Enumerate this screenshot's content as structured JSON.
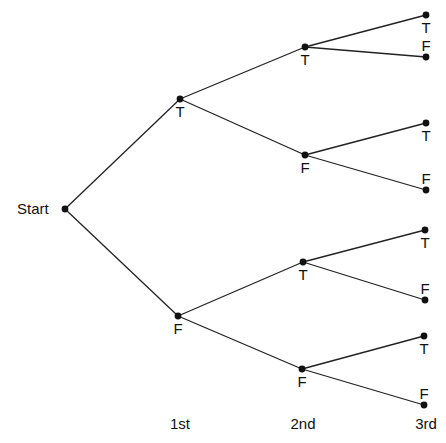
{
  "diagram": {
    "type": "probability-tree",
    "root": {
      "label": "Start",
      "x": 65,
      "y": 209,
      "label_x": 17,
      "label_y": 201
    },
    "levels": [
      {
        "label": "1st",
        "x": 180,
        "y": 416
      },
      {
        "label": "2nd",
        "x": 303,
        "y": 416
      },
      {
        "label": "3rd",
        "x": 426,
        "y": 416
      }
    ],
    "nodes": [
      {
        "id": "n1T",
        "label": "T",
        "level": 1,
        "parent": "root",
        "x": 180,
        "y": 99,
        "label_pos": "below"
      },
      {
        "id": "n1F",
        "label": "F",
        "level": 1,
        "parent": "root",
        "x": 178,
        "y": 316,
        "label_pos": "below"
      },
      {
        "id": "n2TT",
        "label": "T",
        "level": 2,
        "parent": "n1T",
        "x": 305,
        "y": 47,
        "label_pos": "below"
      },
      {
        "id": "n2TF",
        "label": "F",
        "level": 2,
        "parent": "n1T",
        "x": 305,
        "y": 155,
        "label_pos": "below"
      },
      {
        "id": "n2FT",
        "label": "T",
        "level": 2,
        "parent": "n1F",
        "x": 303,
        "y": 262,
        "label_pos": "below"
      },
      {
        "id": "n2FF",
        "label": "F",
        "level": 2,
        "parent": "n1F",
        "x": 302,
        "y": 369,
        "label_pos": "below"
      },
      {
        "id": "n3TTT",
        "label": "T",
        "level": 3,
        "parent": "n2TT",
        "x": 426,
        "y": 15,
        "label_pos": "below"
      },
      {
        "id": "n3TTF",
        "label": "F",
        "level": 3,
        "parent": "n2TT",
        "x": 426,
        "y": 57,
        "label_pos": "above"
      },
      {
        "id": "n3TFT",
        "label": "T",
        "level": 3,
        "parent": "n2TF",
        "x": 426,
        "y": 123,
        "label_pos": "below"
      },
      {
        "id": "n3TFF",
        "label": "F",
        "level": 3,
        "parent": "n2TF",
        "x": 426,
        "y": 190,
        "label_pos": "above"
      },
      {
        "id": "n3FTT",
        "label": "T",
        "level": 3,
        "parent": "n2FT",
        "x": 425,
        "y": 230,
        "label_pos": "below"
      },
      {
        "id": "n3FTF",
        "label": "F",
        "level": 3,
        "parent": "n2FT",
        "x": 425,
        "y": 300,
        "label_pos": "above"
      },
      {
        "id": "n3FFT",
        "label": "T",
        "level": 3,
        "parent": "n2FF",
        "x": 424,
        "y": 336,
        "label_pos": "below"
      },
      {
        "id": "n3FFF",
        "label": "F",
        "level": 3,
        "parent": "n2FF",
        "x": 424,
        "y": 405,
        "label_pos": "above"
      }
    ],
    "style": {
      "line_color": "#222222",
      "dot_color": "#111111",
      "background": "#ffffff"
    }
  }
}
